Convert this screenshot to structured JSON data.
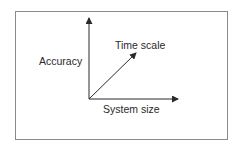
{
  "diagram": {
    "type": "3-axis coordinate sketch",
    "axes": [
      {
        "id": "vertical",
        "label": "Accuracy"
      },
      {
        "id": "diagonal",
        "label": "Time scale"
      },
      {
        "id": "horizontal",
        "label": "System size"
      }
    ],
    "colors": {
      "line": "#2a2a2a",
      "frame": "#8a8a8a",
      "background": "#ffffff"
    }
  }
}
